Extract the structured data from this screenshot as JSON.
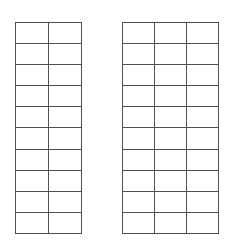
{
  "page": {
    "background_color": "#ffffff",
    "width": 234,
    "height": 244
  },
  "style": {
    "border_color": "#4f4f4f",
    "cell_background": "#ffffff",
    "border_width_px": 1.6
  },
  "tables": [
    {
      "id": "table-left",
      "name": "left-grid-table",
      "rows": 10,
      "columns": 2,
      "position": {
        "x": 15,
        "y": 22,
        "width": 64,
        "height": 201
      },
      "cells": [
        [
          "",
          ""
        ],
        [
          "",
          ""
        ],
        [
          "",
          ""
        ],
        [
          "",
          ""
        ],
        [
          "",
          ""
        ],
        [
          "",
          ""
        ],
        [
          "",
          ""
        ],
        [
          "",
          ""
        ],
        [
          "",
          ""
        ],
        [
          "",
          ""
        ]
      ]
    },
    {
      "id": "table-right",
      "name": "right-grid-table",
      "rows": 10,
      "columns": 3,
      "position": {
        "x": 122,
        "y": 22,
        "width": 93,
        "height": 201
      },
      "cells": [
        [
          "",
          "",
          ""
        ],
        [
          "",
          "",
          ""
        ],
        [
          "",
          "",
          ""
        ],
        [
          "",
          "",
          ""
        ],
        [
          "",
          "",
          ""
        ],
        [
          "",
          "",
          ""
        ],
        [
          "",
          "",
          ""
        ],
        [
          "",
          "",
          ""
        ],
        [
          "",
          "",
          ""
        ],
        [
          "",
          "",
          ""
        ]
      ]
    }
  ]
}
